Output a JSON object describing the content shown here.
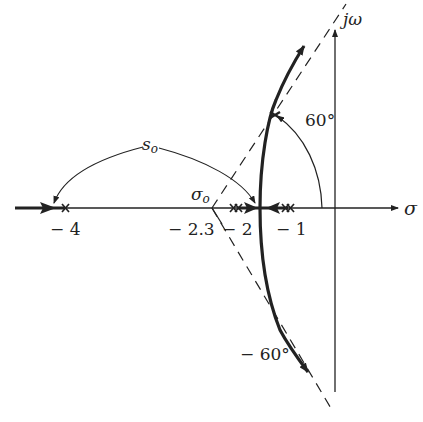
{
  "diagram": {
    "type": "root-locus",
    "axes": {
      "real_label": "σ",
      "imag_label": "jω"
    },
    "poles": [
      -4,
      -2,
      -1
    ],
    "centroid": -2.3,
    "labels": {
      "pole_neg4": "− 4",
      "centroid_value": "− 2.3",
      "pole_neg2": "− 2",
      "pole_neg1": "− 1",
      "centroid_symbol": "σo",
      "so_label": "so",
      "angle_upper": "60°",
      "angle_lower": "− 60°"
    },
    "asymptote_angles_deg": [
      60,
      -60
    ],
    "colors": {
      "ink": "#222222",
      "background": "#ffffff"
    }
  }
}
